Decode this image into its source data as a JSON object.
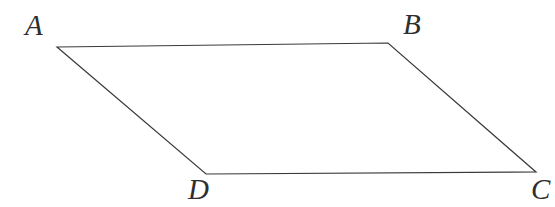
{
  "figure": {
    "kind": "parallelogram-diagram",
    "canvas": {
      "width": 555,
      "height": 207,
      "background": "#ffffff"
    },
    "stroke": {
      "color": "#3a3a3a",
      "width": 1.2
    },
    "vertices": [
      {
        "id": "A",
        "label": "A",
        "x": 57,
        "y": 47,
        "label_x": 25,
        "label_y": 11
      },
      {
        "id": "B",
        "label": "B",
        "x": 388,
        "y": 43,
        "label_x": 403,
        "label_y": 10
      },
      {
        "id": "C",
        "label": "C",
        "x": 536,
        "y": 172,
        "label_x": 531,
        "label_y": 175
      },
      {
        "id": "D",
        "label": "D",
        "x": 206,
        "y": 174,
        "label_x": 188,
        "label_y": 175
      }
    ],
    "edges": [
      {
        "id": "AB",
        "from": "A",
        "to": "B"
      },
      {
        "id": "BC",
        "from": "B",
        "to": "C"
      },
      {
        "id": "CD",
        "from": "C",
        "to": "D"
      },
      {
        "id": "DA",
        "from": "D",
        "to": "A"
      }
    ],
    "polygon_points": "57,47 388,43 536,172 206,174"
  }
}
